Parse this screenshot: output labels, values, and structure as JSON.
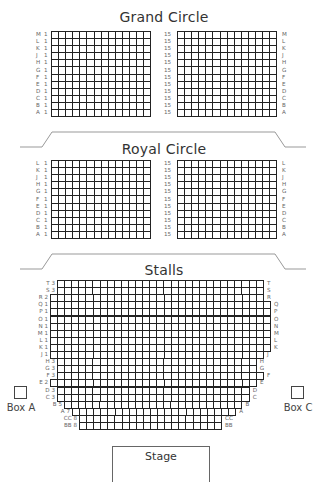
{
  "sections": {
    "grand_circle": {
      "title": "Grand Circle",
      "rows": [
        "M",
        "L",
        "K",
        "J",
        "H",
        "G",
        "F",
        "E",
        "D",
        "C",
        "B",
        "A"
      ],
      "left_start_seat": "1",
      "right_start_seat": "15",
      "columns_per_block": 14
    },
    "royal_circle": {
      "title": "Royal Circle",
      "rows": [
        "L",
        "K",
        "J",
        "H",
        "G",
        "F",
        "E",
        "D",
        "C",
        "B",
        "A"
      ],
      "left_start_seat": "1",
      "right_start_seat": "15",
      "columns_per_block": 14
    },
    "stalls": {
      "title": "Stalls",
      "rows": [
        {
          "row": "T",
          "start": "3"
        },
        {
          "row": "S",
          "start": "3"
        },
        {
          "row": "R",
          "start": "2"
        },
        {
          "row": "Q",
          "start": "1"
        },
        {
          "row": "P",
          "start": "1"
        },
        {
          "row": "O",
          "start": "1"
        },
        {
          "row": "N",
          "start": "1"
        },
        {
          "row": "M",
          "start": "1"
        },
        {
          "row": "L",
          "start": "1"
        },
        {
          "row": "K",
          "start": "1"
        },
        {
          "row": "J",
          "start": "1"
        },
        {
          "row": "H",
          "start": "3"
        },
        {
          "row": "G",
          "start": "3"
        },
        {
          "row": "F",
          "start": "3"
        },
        {
          "row": "E",
          "start": "2"
        },
        {
          "row": "D",
          "start": "3"
        },
        {
          "row": "C",
          "start": "3"
        },
        {
          "row": "B",
          "start": "5"
        },
        {
          "row": "A",
          "start": "7"
        },
        {
          "row": "CC",
          "start": "8"
        },
        {
          "row": "BB",
          "start": "8"
        }
      ]
    }
  },
  "boxes": {
    "box_a": "Box A",
    "box_c": "Box C"
  },
  "stage": {
    "label": "Stage"
  },
  "colors": {
    "grid_line": "#222222",
    "label_text": "#666666",
    "divider": "#999999"
  }
}
